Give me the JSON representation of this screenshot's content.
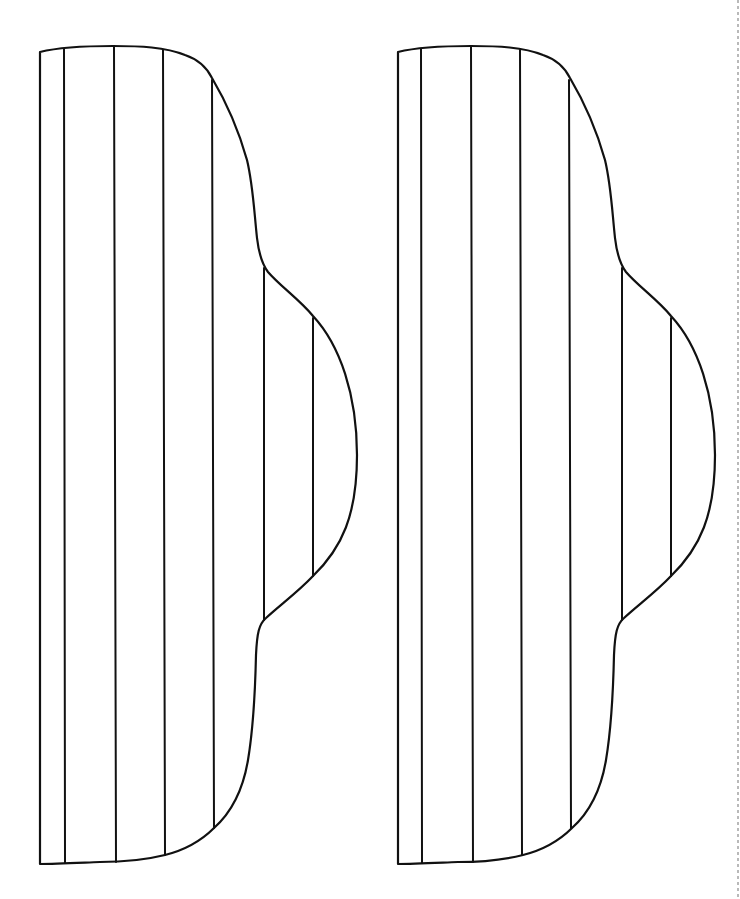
{
  "diagram": {
    "background_color": "#ffffff",
    "stroke_color": "#111111",
    "shapes": [
      {
        "id": "left-shape",
        "offset_x": 0,
        "stripe_x": [
          64,
          115,
          163,
          213,
          264,
          313
        ]
      },
      {
        "id": "right-shape",
        "offset_x": 358,
        "stripe_x": [
          64,
          115,
          163,
          213,
          264,
          313
        ]
      }
    ],
    "page_edge_mark": {
      "x": 738,
      "color": "#b9b9b9",
      "style": "dashed"
    }
  }
}
